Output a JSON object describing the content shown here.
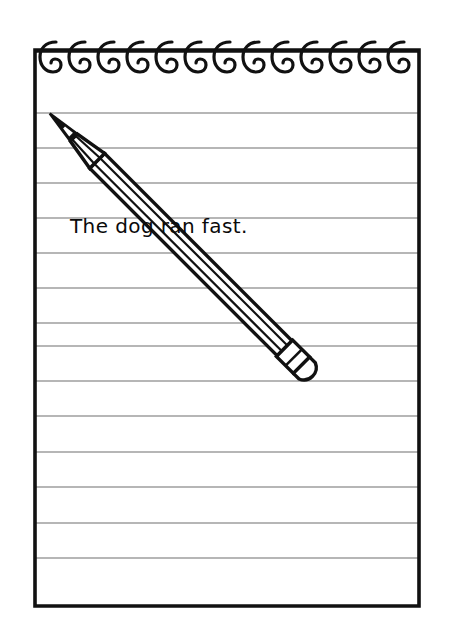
{
  "illustration": {
    "title": "Spiral notepad with pencil",
    "style": "black-and-white line drawing",
    "ink_color": "#111111",
    "rule_line_color": "#6e6e6e",
    "paper_color": "#ffffff"
  },
  "notepad": {
    "binding": {
      "type": "spiral-coil",
      "ring_count": 13,
      "ring_glyph": "C"
    },
    "ruled_lines": {
      "count": 15,
      "spacing_px": 35
    },
    "written_line": {
      "text": "The dog ran fast.",
      "line_index": 4
    }
  },
  "pencil": {
    "label": "pencil",
    "parts": [
      "graphite-tip",
      "wood-cone",
      "barrel",
      "ferrule",
      "eraser"
    ],
    "orientation": "diagonal, tip upper-left, eraser lower-right"
  }
}
